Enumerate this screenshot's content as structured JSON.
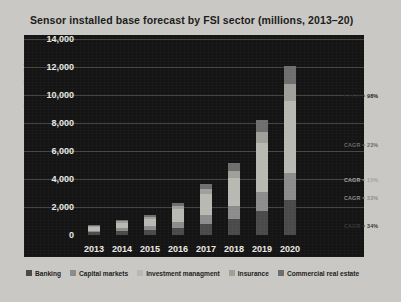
{
  "chart_data": {
    "type": "bar",
    "stacked": true,
    "title": "Sensor installed base forecast by FSI sector (millions, 2013–20)",
    "xlabel": "",
    "ylabel": "Sensor installed base",
    "categories": [
      "2013",
      "2014",
      "2015",
      "2016",
      "2017",
      "2018",
      "2019",
      "2020"
    ],
    "ylim": [
      0,
      14000
    ],
    "yticks": [
      0,
      2000,
      4000,
      6000,
      8000,
      10000,
      12000,
      14000
    ],
    "ytick_labels": [
      "0",
      "2,000",
      "4,000",
      "6,000",
      "8,000",
      "10,000",
      "12,000",
      "14,000"
    ],
    "grid": true,
    "legend_position": "bottom",
    "series": [
      {
        "name": "Banking",
        "color": "#4a4a4a",
        "values": [
          180,
          260,
          330,
          520,
          820,
          1150,
          1700,
          2500
        ]
      },
      {
        "name": "Capital markets",
        "color": "#8c8c8c",
        "values": [
          140,
          210,
          280,
          420,
          640,
          900,
          1350,
          1900
        ]
      },
      {
        "name": "Investment managment",
        "color": "#b9b9b4",
        "values": [
          250,
          380,
          520,
          900,
          1450,
          2000,
          3500,
          5200
        ]
      },
      {
        "name": "Insurance",
        "color": "#a0a09a",
        "values": [
          90,
          130,
          180,
          260,
          380,
          520,
          780,
          1200
        ]
      },
      {
        "name": "Commercial real estate",
        "color": "#6e6e6e",
        "values": [
          60,
          90,
          120,
          200,
          330,
          560,
          870,
          1300
        ]
      }
    ],
    "annotations": [
      {
        "label": "CAGR = 98%",
        "value": 98,
        "series": "Commercial real estate",
        "y_px": 93,
        "color": "#1f1f1f"
      },
      {
        "label": "CAGR = 23%",
        "value": 23,
        "series": "Investment managment",
        "y_px": 142,
        "color": "#6a6a6a"
      },
      {
        "label": "CAGR = 15%",
        "value": 15,
        "series": "Insurance",
        "y_px": 177,
        "color": "#a4a49f"
      },
      {
        "label": "CAGR = 33%",
        "value": 33,
        "series": "Capital markets",
        "y_px": 195,
        "color": "#8e8e8a"
      },
      {
        "label": "CAGR = 34%",
        "value": 34,
        "series": "Banking",
        "y_px": 223,
        "color": "#3a3a3a"
      }
    ]
  },
  "colors": {
    "page_background": "#c9c8c4",
    "panel_background": "#141414",
    "gridline": "#555450",
    "tick_text": "#eceae5",
    "title_text": "#1c1c1c"
  }
}
